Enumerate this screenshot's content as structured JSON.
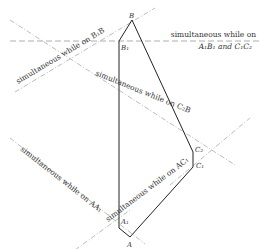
{
  "diagram": {
    "points": {
      "B": "B",
      "B1": "B₁",
      "C2": "C₂",
      "C1": "C₁",
      "A1": "A₁",
      "A": "A"
    },
    "annotations": {
      "horizontal_line_1": "simultaneous while on",
      "horizontal_line_2": "A₁B₁ and C₁C₂",
      "b1b": "simultaneous while on B₁B",
      "c2b": "simultaneous while on C₂B",
      "aa1": "simultaneous while on AA₁",
      "ac1": "simultaneous while on AC₁"
    }
  }
}
